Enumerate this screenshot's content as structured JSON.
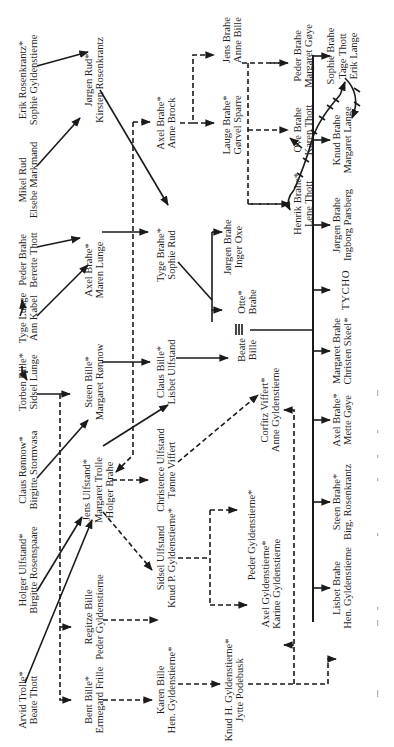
{
  "diagram": {
    "orientation": "rotated 90° counter-clockwise",
    "legend_marker": "*",
    "people": [
      {
        "id": "erik-rosenkrantz",
        "lines": [
          "Erik Rosenkrantz*",
          "Sophie Gyldenstierne"
        ]
      },
      {
        "id": "mikel-rud",
        "lines": [
          "Mikel Rud",
          "Elsebe Markmand"
        ]
      },
      {
        "id": "peder-brahe-sr",
        "lines": [
          "Peder Brahe",
          "Berette Thott"
        ]
      },
      {
        "id": "tyge-lunge",
        "lines": [
          "Tyge Lunge",
          "Ann Kabel"
        ]
      },
      {
        "id": "torben-bille",
        "lines": [
          "Torben Bille*",
          "Sidsel Lunge"
        ]
      },
      {
        "id": "claus-ronnow",
        "lines": [
          "Claus Rønnow*",
          "Birgitte Stormvasa"
        ]
      },
      {
        "id": "holger-ulfstand",
        "lines": [
          "Holger Ulfstand*",
          "Birgitte Rosenspaare"
        ]
      },
      {
        "id": "arvid-trolle",
        "lines": [
          "Arvid Trolle*",
          "Beate Thott"
        ]
      },
      {
        "id": "jorgen-rud",
        "lines": [
          "Jørgen Rud*",
          "Kirsten Rosenkrantz"
        ]
      },
      {
        "id": "axel-brahe-maren",
        "lines": [
          "Axel Brahe*",
          "Maren Lunge"
        ]
      },
      {
        "id": "steen-bille",
        "lines": [
          "Steen Bille*",
          "Margaret Rønnow"
        ]
      },
      {
        "id": "jens-ulfstand",
        "lines": [
          "Jens Ulfstand*",
          "Margaret Trolle",
          "Holger Brahe"
        ]
      },
      {
        "id": "regitze-bille",
        "lines": [
          "Regitze Bille",
          "Peder Gyldenstierne"
        ]
      },
      {
        "id": "bent-bille",
        "lines": [
          "Bent Bille*",
          "Ermegard Frille"
        ]
      },
      {
        "id": "axel-brahe-anne",
        "lines": [
          "Axel Brahe*",
          "Anne Brock"
        ]
      },
      {
        "id": "tyge-brahe",
        "lines": [
          "Tyge Brahe*",
          "Sophie Rud"
        ]
      },
      {
        "id": "claus-bille",
        "lines": [
          "Claus Bille*",
          "Lisbet Ulfstand"
        ]
      },
      {
        "id": "christence-ulfstand",
        "lines": [
          "Christence Ulfstand",
          "Tønne Viffert"
        ]
      },
      {
        "id": "sidsel-ulfstand",
        "lines": [
          "Sidsel Ulfstand",
          "Knud P. Gyldenstierne*"
        ]
      },
      {
        "id": "karen-bille",
        "lines": [
          "Karen Bille",
          "Hen. Gyldenstierne*"
        ]
      },
      {
        "id": "jens-brahe",
        "lines": [
          "Jens Brahe",
          "Anne Bille"
        ]
      },
      {
        "id": "lauge-brahe",
        "lines": [
          "Lauge Brahe*",
          "Gørvel Sparre"
        ]
      },
      {
        "id": "jorgen-brahe-inger",
        "lines": [
          "Jørgen Brahe",
          "Inger Oxe"
        ]
      },
      {
        "id": "otte-brahe",
        "lines": [
          "Otte*",
          "Brahe"
        ]
      },
      {
        "id": "beate-bille",
        "lines": [
          "Beate",
          "Bille"
        ]
      },
      {
        "id": "corfitz-viffert",
        "lines": [
          "Corfitz Viffert*",
          "Anne Gyldenstierne"
        ]
      },
      {
        "id": "peder-gyldenstierne",
        "lines": [
          "Peder Gyldenstierne*"
        ]
      },
      {
        "id": "axel-gyldenstierne",
        "lines": [
          "Axel Gyldenstierne*",
          "Karine Gyldenstierne"
        ]
      },
      {
        "id": "knud-h-gyldenstierne",
        "lines": [
          "Knud H. Gyldenstierne*",
          "Jytte Podebusk"
        ]
      },
      {
        "id": "peder-brahe",
        "lines": [
          "Peder Brahe",
          "Margaret Gøye"
        ]
      },
      {
        "id": "ove-brahe",
        "lines": [
          "Ove Brahe",
          "Karen Thott"
        ]
      },
      {
        "id": "henrik-brahe",
        "lines": [
          "Henrik Brahe*",
          "Lene Thott"
        ]
      },
      {
        "id": "sophie-brahe",
        "lines": [
          "Sophie Brahe",
          "Tage Thott",
          "Erik Lange"
        ]
      },
      {
        "id": "knud-brahe",
        "lines": [
          "Knud Brahe",
          "Margaret Lange"
        ]
      },
      {
        "id": "jorgen-brahe-ingborg",
        "lines": [
          "Jørgen Brahe",
          "Ingborg Parsberg"
        ]
      },
      {
        "id": "tycho",
        "lines": [
          "TYCHO"
        ]
      },
      {
        "id": "margaret-brahe",
        "lines": [
          "Margaret Brahe",
          "Christen Skeel*"
        ]
      },
      {
        "id": "axel-brahe-mette",
        "lines": [
          "Axel Brahe*",
          "Mette Gøye"
        ]
      },
      {
        "id": "steen-brahe",
        "lines": [
          "Steen Brahe*",
          "Birg. Rosenkrantz"
        ]
      },
      {
        "id": "lisbet-brahe",
        "lines": [
          "Lisbet Brahe",
          "Hen. Gyldenstierne"
        ]
      }
    ],
    "line_styles": {
      "solid": "direct descent",
      "dashed": "descent line",
      "triple": "marriage"
    }
  }
}
